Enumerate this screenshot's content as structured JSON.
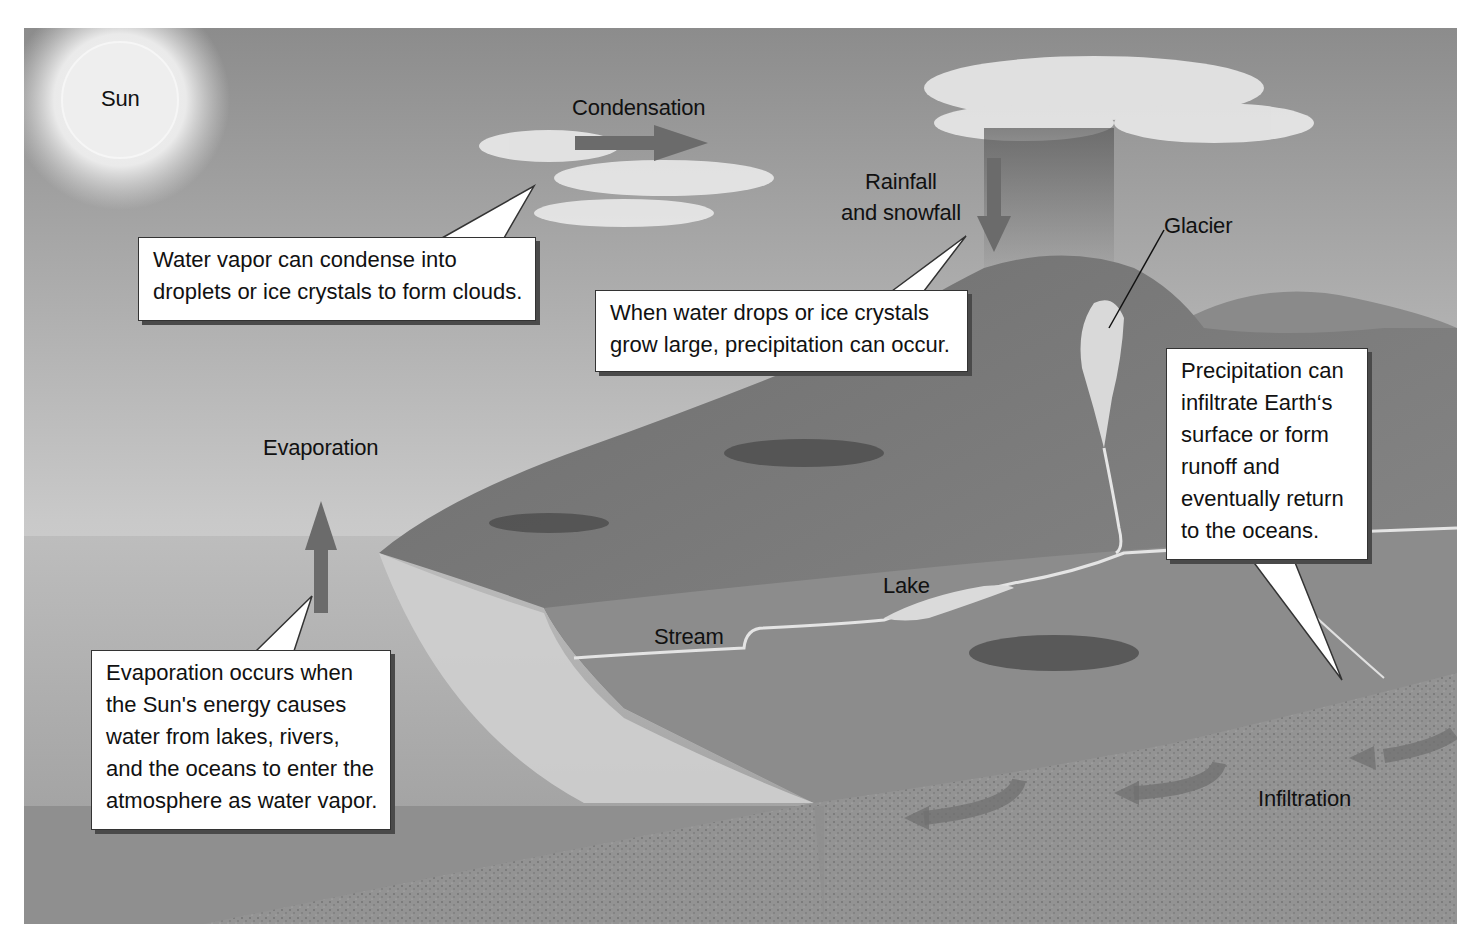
{
  "labels": {
    "sun": "Sun",
    "condensation": "Condensation",
    "rainfall_line1": "Rainfall",
    "rainfall_line2": "and snowfall",
    "glacier": "Glacier",
    "evaporation": "Evaporation",
    "lake": "Lake",
    "stream": "Stream",
    "infiltration": "Infiltration"
  },
  "callouts": {
    "condense": {
      "lines": [
        "Water vapor can condense into",
        "droplets or ice crystals to form clouds."
      ]
    },
    "precipitation": {
      "lines": [
        "When water drops or ice crystals",
        "grow large, precipitation can occur."
      ]
    },
    "runoff": {
      "lines": [
        "Precipitation can",
        "infiltrate Earth‘s",
        "surface or form",
        "runoff and",
        "eventually return",
        "to the oceans."
      ]
    },
    "evaporation": {
      "lines": [
        "Evaporation occurs when",
        "the Sun's energy causes",
        "water from lakes,  rivers,",
        "and the oceans to enter the",
        "atmosphere as water vapor."
      ]
    }
  },
  "colors": {
    "arrow": "#6b6b6b",
    "sky_top": "#8a8a8a",
    "sky_bottom": "#e2e2e2",
    "ocean": "#9a9a9a",
    "land": "#7d7d7d",
    "ground": "#8f8f8f"
  }
}
